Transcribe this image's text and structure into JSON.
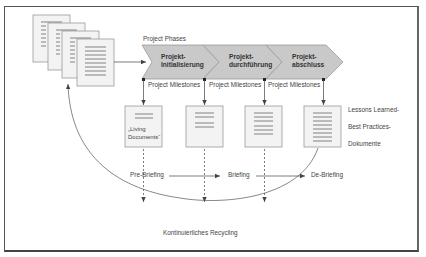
{
  "diagram": {
    "phases_title": "Project Phases",
    "phases": [
      {
        "line1": "Projekt-",
        "line2": "Initialisierung"
      },
      {
        "line1": "Projekt-",
        "line2": "durchführung"
      },
      {
        "line1": "Projekt-",
        "line2": "abschluss"
      }
    ],
    "milestones": [
      "Project Milestones",
      "Project Milestones",
      "Project Milestones"
    ],
    "living_documents": {
      "line1": "„Living",
      "line2": "Documents“"
    },
    "lessons": [
      "Lessons Learned-",
      "Best Practices-",
      "Dokumente"
    ],
    "briefings": [
      "Pre-Briefing",
      "Briefing",
      "De-Briefing"
    ],
    "recycling": "Kontinuierliches Recycling",
    "colors": {
      "chevron_fill": "#c9c9c9",
      "chevron_stroke": "#9a9a9a",
      "doc_fill": "#f3f3f3",
      "doc_stroke": "#9a9a9a",
      "line": "#555555"
    }
  }
}
